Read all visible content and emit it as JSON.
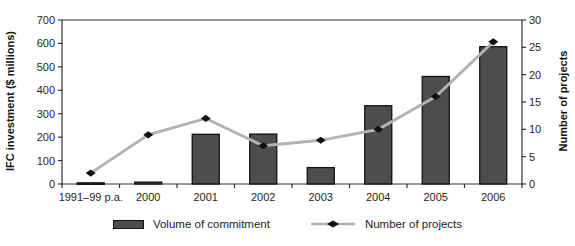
{
  "chart_data": {
    "type": "bar+line",
    "categories": [
      "1991–99 p.a.",
      "2000",
      "2001",
      "2002",
      "2003",
      "2004",
      "2005",
      "2006"
    ],
    "series": [
      {
        "name": "Volume of commitment",
        "type": "bar",
        "axis": "left",
        "values": [
          5,
          8,
          212,
          213,
          70,
          334,
          459,
          586
        ]
      },
      {
        "name": "Number of projects",
        "type": "line",
        "axis": "right",
        "values": [
          2,
          9,
          12,
          7,
          8,
          10,
          16,
          26
        ]
      }
    ],
    "title": "",
    "xlabel": "",
    "ylabel_left": "IFC investment ($ millions)",
    "ylabel_right": "Number of projects",
    "ylim_left": [
      0,
      700
    ],
    "ytick_step_left": 100,
    "ylim_right": [
      0,
      30
    ],
    "ytick_step_right": 5,
    "grid": "off",
    "legend_position": "bottom",
    "colors": {
      "bar_fill": "#4d4d4d",
      "bar_border": "#111111",
      "line": "#b2b2b2",
      "marker": "#111111",
      "axis": "#333333",
      "text": "#1f1f1f"
    },
    "legend": {
      "volume_label": "Volume of commitment",
      "projects_label": "Number of projects"
    }
  }
}
